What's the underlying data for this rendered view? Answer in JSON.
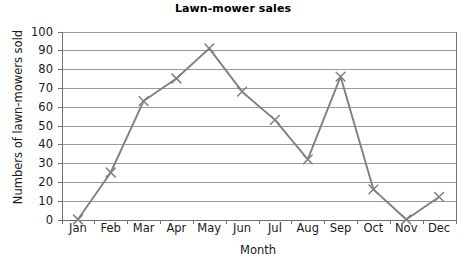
{
  "chart_data": {
    "type": "line",
    "title": "Lawn-mower sales",
    "xlabel": "Month",
    "ylabel": "Numbers of lawn-mowers sold",
    "categories": [
      "Jan",
      "Feb",
      "Mar",
      "Apr",
      "May",
      "Jun",
      "Jul",
      "Aug",
      "Sep",
      "Oct",
      "Nov",
      "Dec"
    ],
    "values": [
      0,
      25,
      63,
      75,
      91,
      68,
      53,
      32,
      76,
      16,
      0,
      12
    ],
    "series": [
      {
        "name": "Lawn-mowers sold",
        "values": [
          0,
          25,
          63,
          75,
          91,
          68,
          53,
          32,
          76,
          16,
          0,
          12
        ]
      }
    ],
    "ylim": [
      0,
      100
    ],
    "ytick_values": [
      0,
      10,
      20,
      30,
      40,
      50,
      60,
      70,
      80,
      90,
      100
    ],
    "ytick_labels": [
      "0",
      "10",
      "20",
      "30",
      "40",
      "50",
      "60",
      "70",
      "80",
      "90",
      "100"
    ],
    "grid": true,
    "grid_axis": "y",
    "legend": false,
    "legend_position": "none",
    "marker": "x",
    "line_color": "#808080",
    "marker_color": "#808080",
    "grid_color": "#9a9a9a",
    "axis_color": "#707070",
    "background_color": "#ffffff",
    "title_color": "#000000"
  }
}
